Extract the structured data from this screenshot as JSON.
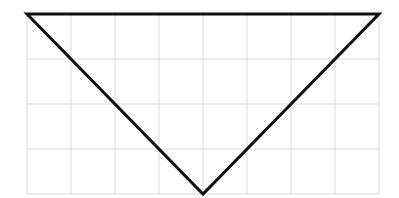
{
  "figure": {
    "grid": {
      "columns": 8,
      "rows": 4,
      "left": 27,
      "top": 14,
      "cell_width": 44,
      "cell_height": 45,
      "line_color": "#d9d9d9"
    },
    "triangle": {
      "stroke_color": "#111111",
      "stroke_width": 3,
      "vertices": [
        {
          "label": "top-left",
          "col": 0,
          "row": 0
        },
        {
          "label": "top-right",
          "col": 8,
          "row": 0
        },
        {
          "label": "bottom",
          "col": 4,
          "row": 4
        }
      ]
    }
  }
}
